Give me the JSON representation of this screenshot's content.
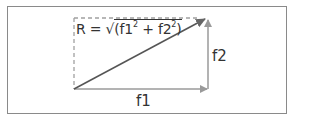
{
  "diagram": {
    "formula": {
      "prefix": "R = ",
      "sqrt": "√",
      "open": "(f1",
      "exp1": "2",
      "plus": " + f2",
      "exp2": "2",
      "close": ")"
    },
    "labels": {
      "horizontal": "f1",
      "vertical": "f2"
    },
    "colors": {
      "frame": "#8a8a8a",
      "arrow": "#9a9a9a",
      "resultant": "#555555",
      "dashed": "#a0a0a0",
      "text": "#333333"
    }
  }
}
